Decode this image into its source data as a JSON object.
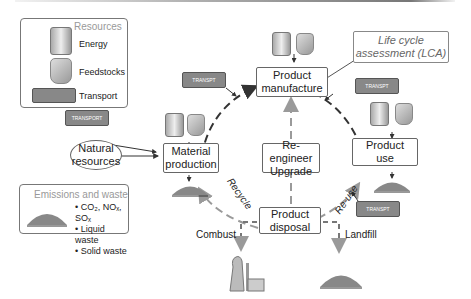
{
  "resources_panel": {
    "title": "Resources",
    "items": [
      {
        "icon": "energy-can-icon",
        "label": "Energy",
        "icon_text": "ENERGY"
      },
      {
        "icon": "feedstock-sack-icon",
        "label": "Feedstocks",
        "icon_text": "FEED STOCK"
      },
      {
        "icon": "transport-truck-icon",
        "label": "Transport",
        "icon_text": "TRANSPORT"
      }
    ]
  },
  "emissions_panel": {
    "title": "Emissions and waste",
    "items": [
      "CO₂, NOₓ, SOₓ",
      "Liquid waste",
      "Solid waste"
    ]
  },
  "nodes": {
    "natural_resources": [
      "Natural",
      "resources"
    ],
    "material_production": [
      "Material",
      "production"
    ],
    "product_manufacture": [
      "Product",
      "manufacture"
    ],
    "product_use": [
      "Product",
      "use"
    ],
    "product_disposal": [
      "Product",
      "disposal"
    ],
    "reengineer": [
      "Re-engineer",
      "Upgrade"
    ],
    "lca": [
      "Life cycle",
      "assessment (LCA)"
    ]
  },
  "flow_labels": {
    "recycle": "Recycle",
    "reuse": "Re-use",
    "combust": "Combust",
    "landfill": "Landfill"
  },
  "truck_labels": {
    "t1": "TRANSPORT",
    "t2": "TRANSPT",
    "t3": "TRANSPT",
    "t4": "TRANSPT"
  },
  "can_label": "ENERGY",
  "sack_label": "FEED STOCK",
  "colors": {
    "cycle_dark": "#333333",
    "cycle_light": "#9a9a9a",
    "border": "#666666",
    "muted_text": "#999999"
  }
}
